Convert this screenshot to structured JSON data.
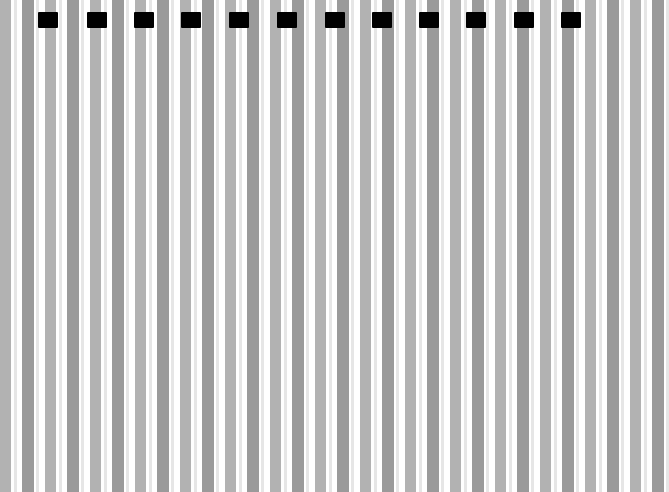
{
  "canvas": {
    "width": 616,
    "height": 492,
    "background": "#ffffff"
  },
  "pattern": {
    "period": 22.5,
    "stripes_per_period": [
      {
        "offset": 0,
        "width": 10,
        "color": "#b4b4b4"
      },
      {
        "offset": 22,
        "width": 11,
        "color": "#9c9c9c"
      }
    ]
  },
  "blocks": {
    "color": "#000000",
    "top": 12,
    "width": 20,
    "height": 16,
    "x_positions": [
      38,
      87,
      134,
      181,
      229,
      277,
      325,
      372,
      419,
      466,
      514,
      561
    ]
  }
}
